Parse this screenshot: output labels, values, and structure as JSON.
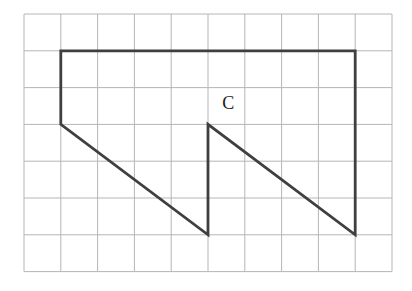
{
  "figure": {
    "label": "C",
    "label_pos": {
      "col": 5.55,
      "row": 2.42
    },
    "label_color": "#1c1c1c",
    "label_font_px": 18,
    "canvas": {
      "width": 412,
      "height": 291,
      "background": "#ffffff"
    },
    "grid": {
      "cols": 10,
      "rows": 7,
      "origin_x": 24,
      "origin_y": 14,
      "cell": 36.8,
      "line_color": "#b6b6b6",
      "line_width": 1
    },
    "shape": {
      "name": "polygon-C",
      "stroke": "#3f3f3f",
      "stroke_width": 2.8,
      "fill": "none",
      "vertices_grid": [
        {
          "col": 1,
          "row": 1
        },
        {
          "col": 9,
          "row": 1
        },
        {
          "col": 9,
          "row": 6
        },
        {
          "col": 5,
          "row": 3
        },
        {
          "col": 5,
          "row": 6
        },
        {
          "col": 1,
          "row": 3
        }
      ]
    }
  }
}
